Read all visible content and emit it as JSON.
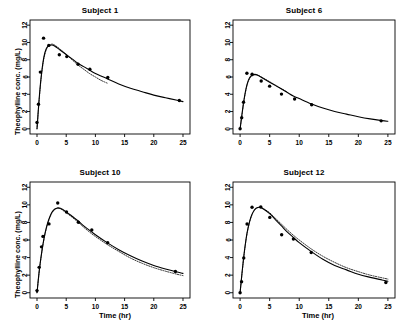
{
  "figure": {
    "background": "#ffffff",
    "foreground": "#000000",
    "layout": "2x2 grid of panels"
  },
  "axes": {
    "xlabel": "Time (hr)",
    "ylabel": "Theophylline conc. (mg/L)",
    "xticks": [
      0,
      5,
      10,
      15,
      20,
      25
    ],
    "yticks": [
      0,
      2,
      4,
      6,
      8,
      10,
      12
    ],
    "xlim": [
      -1.2,
      26.2
    ],
    "ylim": [
      -0.6,
      12.6
    ]
  },
  "chart_data": [
    {
      "type": "scatter",
      "title": "Subject 1",
      "xlabel": "Time (hr)",
      "ylabel": "Theophylline conc. (mg/L)",
      "xlim": [
        -1.2,
        26.2
      ],
      "ylim": [
        -0.6,
        12.6
      ],
      "xticks": [
        0,
        5,
        10,
        15,
        20,
        25
      ],
      "yticks": [
        0,
        2,
        4,
        6,
        8,
        10,
        12
      ],
      "grid": false,
      "legend": "none",
      "observed": {
        "name": "Observed concentration",
        "marker": "filled-circle",
        "x": [
          0.0,
          0.25,
          0.57,
          1.12,
          2.02,
          3.82,
          5.1,
          7.03,
          9.05,
          12.12,
          24.37
        ],
        "y": [
          0.74,
          2.84,
          6.57,
          10.5,
          9.66,
          8.58,
          8.36,
          7.47,
          6.89,
          5.94,
          3.28
        ]
      },
      "series": [
        {
          "name": "Individual fit",
          "style": "solid",
          "x": [
            0.0,
            0.3,
            0.6,
            0.9,
            1.2,
            1.6,
            2.0,
            2.5,
            3.0,
            4.0,
            5.0,
            6.0,
            7.0,
            8.0,
            9.0,
            10.0,
            12.0,
            14.0,
            16.0,
            18.0,
            20.0,
            22.0,
            24.0,
            25.0
          ],
          "y": [
            0.0,
            2.9,
            5.3,
            7.1,
            8.4,
            9.3,
            9.6,
            9.7,
            9.6,
            9.1,
            8.6,
            8.1,
            7.6,
            7.2,
            6.8,
            6.4,
            5.8,
            5.2,
            4.7,
            4.3,
            3.9,
            3.6,
            3.3,
            3.15
          ]
        },
        {
          "name": "Population fit",
          "style": "dotted",
          "x": [
            0.0,
            0.3,
            0.6,
            0.9,
            1.2,
            1.6,
            2.0,
            2.5,
            3.0,
            4.0,
            5.0,
            6.0,
            7.0,
            8.0,
            9.0,
            10.0,
            11.0,
            12.0
          ],
          "y": [
            0.0,
            2.7,
            5.1,
            6.9,
            8.2,
            9.2,
            9.6,
            9.8,
            9.7,
            9.2,
            8.6,
            8.0,
            7.4,
            6.9,
            6.4,
            6.0,
            5.6,
            5.3
          ]
        }
      ]
    },
    {
      "type": "scatter",
      "title": "Subject 6",
      "xlabel": "Time (hr)",
      "ylabel": "Theophylline conc. (mg/L)",
      "xlim": [
        -1.2,
        26.2
      ],
      "ylim": [
        -0.6,
        12.6
      ],
      "xticks": [
        0,
        5,
        10,
        15,
        20,
        25
      ],
      "yticks": [
        0,
        2,
        4,
        6,
        8,
        10,
        12
      ],
      "grid": false,
      "legend": "none",
      "observed": {
        "name": "Observed concentration",
        "marker": "filled-circle",
        "x": [
          0.0,
          0.27,
          0.58,
          1.15,
          2.03,
          3.57,
          5.0,
          7.0,
          9.22,
          12.1,
          23.85
        ],
        "y": [
          0.0,
          1.29,
          3.08,
          6.44,
          6.32,
          5.53,
          4.94,
          4.02,
          3.46,
          2.78,
          0.92
        ]
      },
      "series": [
        {
          "name": "Individual fit",
          "style": "solid",
          "x": [
            0.0,
            0.3,
            0.6,
            0.9,
            1.2,
            1.6,
            2.0,
            2.5,
            3.0,
            4.0,
            5.0,
            6.0,
            7.0,
            8.0,
            9.0,
            10.0,
            12.0,
            14.0,
            16.0,
            18.0,
            20.0,
            22.0,
            24.0,
            25.0
          ],
          "y": [
            0.0,
            1.6,
            3.1,
            4.3,
            5.2,
            5.9,
            6.2,
            6.3,
            6.2,
            5.8,
            5.4,
            5.0,
            4.6,
            4.2,
            3.8,
            3.5,
            2.9,
            2.4,
            2.0,
            1.7,
            1.4,
            1.15,
            0.95,
            0.87
          ]
        },
        {
          "name": "Population fit",
          "style": "dotted",
          "x": [
            0.0,
            0.3,
            0.6,
            0.9,
            1.2,
            1.6,
            2.0,
            2.5,
            3.0,
            4.0,
            5.0,
            6.0,
            7.0,
            8.0
          ],
          "y": [
            0.0,
            1.5,
            3.0,
            4.2,
            5.1,
            5.8,
            6.1,
            6.25,
            6.2,
            5.85,
            5.45,
            5.05,
            4.65,
            4.25
          ]
        }
      ]
    },
    {
      "type": "scatter",
      "title": "Subject 10",
      "xlabel": "Time (hr)",
      "ylabel": "Theophylline conc. (mg/L)",
      "xlim": [
        -1.2,
        26.2
      ],
      "ylim": [
        -0.6,
        12.6
      ],
      "xticks": [
        0,
        5,
        10,
        15,
        20,
        25
      ],
      "yticks": [
        0,
        2,
        4,
        6,
        8,
        10,
        12
      ],
      "grid": false,
      "legend": "none",
      "observed": {
        "name": "Observed concentration",
        "marker": "filled-circle",
        "x": [
          0.0,
          0.37,
          0.77,
          1.02,
          2.05,
          3.55,
          5.05,
          7.08,
          9.38,
          12.1,
          23.7
        ],
        "y": [
          0.24,
          2.89,
          5.22,
          6.41,
          7.83,
          10.21,
          9.18,
          8.02,
          7.14,
          5.68,
          2.42
        ]
      },
      "series": [
        {
          "name": "Individual fit",
          "style": "solid",
          "x": [
            0.0,
            0.4,
            0.8,
            1.2,
            1.6,
            2.0,
            2.5,
            3.0,
            3.5,
            4.0,
            5.0,
            6.0,
            7.0,
            8.0,
            9.0,
            10.0,
            12.0,
            14.0,
            16.0,
            18.0,
            20.0,
            22.0,
            24.0,
            25.0
          ],
          "y": [
            0.0,
            2.6,
            4.6,
            6.2,
            7.4,
            8.3,
            9.1,
            9.5,
            9.65,
            9.6,
            9.2,
            8.7,
            8.2,
            7.6,
            7.1,
            6.6,
            5.7,
            4.9,
            4.2,
            3.6,
            3.1,
            2.7,
            2.35,
            2.2
          ]
        },
        {
          "name": "Population fit",
          "style": "dotted",
          "x": [
            0.0,
            0.4,
            0.8,
            1.2,
            1.6,
            2.0,
            2.5,
            3.0,
            3.5,
            4.0,
            5.0,
            6.0,
            7.0,
            8.0,
            9.0,
            10.0,
            12.0,
            14.0,
            16.0,
            18.0,
            20.0,
            22.0,
            24.0,
            25.0
          ],
          "y": [
            0.0,
            2.5,
            4.5,
            6.1,
            7.3,
            8.2,
            9.0,
            9.45,
            9.6,
            9.55,
            9.1,
            8.6,
            8.05,
            7.45,
            6.9,
            6.4,
            5.5,
            4.7,
            3.95,
            3.35,
            2.85,
            2.45,
            2.1,
            1.95
          ]
        }
      ]
    },
    {
      "type": "scatter",
      "title": "Subject 12",
      "xlabel": "Time (hr)",
      "ylabel": "Theophylline conc. (mg/L)",
      "xlim": [
        -1.2,
        26.2
      ],
      "ylim": [
        -0.6,
        12.6
      ],
      "xticks": [
        0,
        5,
        10,
        15,
        20,
        25
      ],
      "yticks": [
        0,
        2,
        4,
        6,
        8,
        10,
        12
      ],
      "grid": false,
      "legend": "none",
      "observed": {
        "name": "Observed concentration",
        "marker": "filled-circle",
        "x": [
          0.0,
          0.25,
          0.62,
          1.18,
          2.02,
          3.5,
          5.02,
          7.03,
          9.02,
          12.03,
          24.65
        ],
        "y": [
          0.0,
          1.25,
          3.96,
          7.82,
          9.72,
          9.75,
          8.57,
          6.59,
          6.11,
          4.57,
          1.17
        ]
      },
      "series": [
        {
          "name": "Individual fit",
          "style": "solid",
          "x": [
            0.0,
            0.3,
            0.6,
            0.9,
            1.2,
            1.6,
            2.0,
            2.5,
            3.0,
            3.5,
            4.0,
            5.0,
            6.0,
            7.0,
            8.0,
            9.0,
            10.0,
            12.0,
            14.0,
            16.0,
            18.0,
            20.0,
            22.0,
            24.0,
            25.0
          ],
          "y": [
            0.0,
            2.1,
            4.0,
            5.6,
            6.9,
            8.1,
            8.9,
            9.5,
            9.7,
            9.7,
            9.5,
            9.0,
            8.3,
            7.6,
            6.9,
            6.3,
            5.7,
            4.7,
            3.8,
            3.1,
            2.6,
            2.1,
            1.75,
            1.45,
            1.3
          ]
        },
        {
          "name": "Population fit",
          "style": "dotted",
          "x": [
            0.0,
            0.3,
            0.6,
            0.9,
            1.2,
            1.6,
            2.0,
            2.5,
            3.0,
            3.5,
            4.0,
            5.0,
            6.0,
            7.0,
            8.0,
            9.0,
            10.0,
            12.0,
            14.0,
            16.0,
            18.0,
            20.0,
            22.0,
            24.0,
            25.0
          ],
          "y": [
            0.0,
            2.0,
            3.9,
            5.5,
            6.8,
            8.0,
            8.85,
            9.45,
            9.7,
            9.72,
            9.55,
            9.1,
            8.45,
            7.8,
            7.15,
            6.55,
            6.0,
            5.0,
            4.15,
            3.45,
            2.85,
            2.4,
            2.0,
            1.7,
            1.55
          ]
        }
      ]
    }
  ]
}
